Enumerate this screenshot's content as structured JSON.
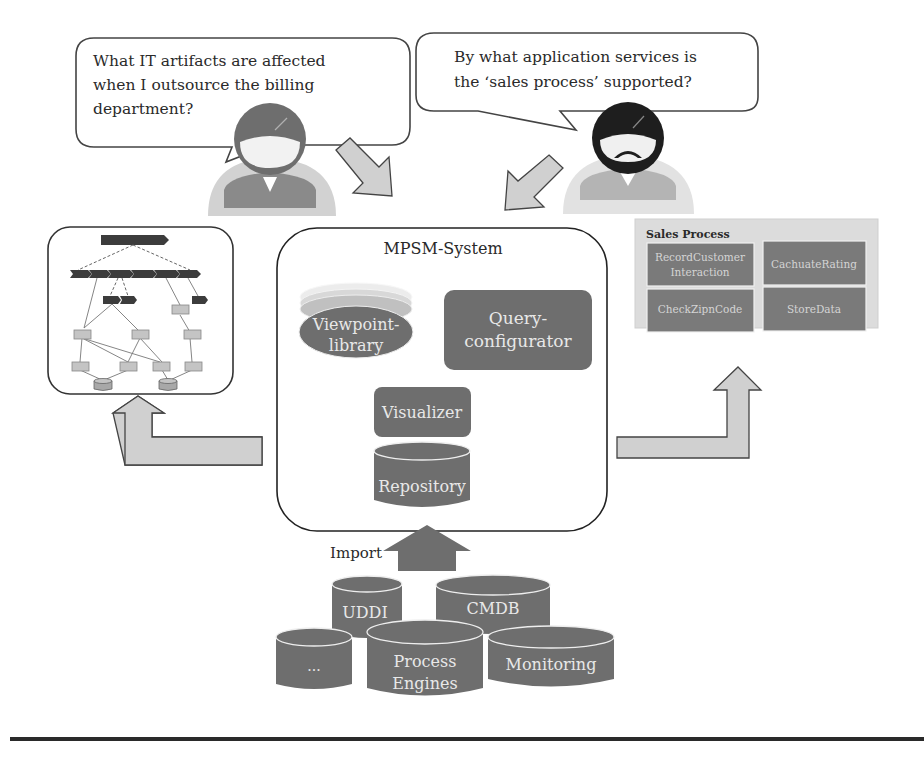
{
  "bubbles": {
    "left": {
      "lines": [
        "What IT artifacts are affected",
        "when I outsource the billing",
        "department?"
      ]
    },
    "right": {
      "lines": [
        "By what application services is",
        "the ‘sales process’ supported?"
      ]
    }
  },
  "system": {
    "title": "MPSM-System",
    "viewpoint_library": [
      "Viewpoint-",
      "library"
    ],
    "query_configurator": [
      "Query-",
      "configurator"
    ],
    "visualizer": "Visualizer",
    "repository": "Repository"
  },
  "import": {
    "label": "Import",
    "sources": {
      "uddi": "UDDI",
      "cmdb": "CMDB",
      "other": "...",
      "process_engines": [
        "Process",
        "Engines"
      ],
      "monitoring": "Monitoring"
    }
  },
  "sales_process": {
    "title": "Sales Process",
    "services": [
      [
        "RecordCustomer",
        "Interaction"
      ],
      [
        "CachuateRating"
      ],
      [
        "CheckZipnCode"
      ],
      [
        "StoreData"
      ]
    ]
  },
  "colors": {
    "dark_box": "#6e6e6e",
    "light_fill": "#d0d0d0",
    "panel_bg": "#dcdcdc",
    "outline": "#333333"
  }
}
